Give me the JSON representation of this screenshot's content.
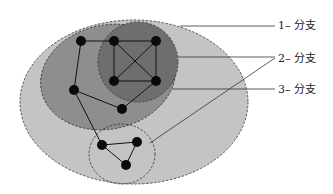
{
  "diagram": {
    "labels": [
      {
        "id": "branch-1",
        "text": "1– 分支",
        "x": 278,
        "y": 20
      },
      {
        "id": "branch-2",
        "text": "2– 分支",
        "x": 278,
        "y": 53
      },
      {
        "id": "branch-3",
        "text": "3– 分支",
        "x": 278,
        "y": 84
      }
    ],
    "regions": [
      {
        "name": "outer-region",
        "shape": "ellipse",
        "cx": 134,
        "cy": 102,
        "rx": 114,
        "ry": 82,
        "fill": "#c4c4c4"
      },
      {
        "name": "middle-region",
        "shape": "ellipse",
        "cx": 108,
        "cy": 77,
        "rx": 68,
        "ry": 52,
        "fill": "#8e8e8e"
      },
      {
        "name": "inner-region",
        "shape": "ellipse",
        "cx": 138,
        "cy": 62,
        "rx": 40,
        "ry": 40,
        "fill": "#6e6e6e"
      },
      {
        "name": "small-region",
        "shape": "ellipse",
        "cx": 122,
        "cy": 154,
        "rx": 33,
        "ry": 30,
        "fill": "#c4c4c4"
      }
    ],
    "nodes": [
      {
        "id": 1,
        "x": 81,
        "y": 41
      },
      {
        "id": 2,
        "x": 114,
        "y": 41
      },
      {
        "id": 3,
        "x": 156,
        "y": 41
      },
      {
        "id": 4,
        "x": 114,
        "y": 81
      },
      {
        "id": 5,
        "x": 156,
        "y": 81
      },
      {
        "id": 6,
        "x": 74,
        "y": 90
      },
      {
        "id": 7,
        "x": 122,
        "y": 109
      },
      {
        "id": 8,
        "x": 102,
        "y": 145
      },
      {
        "id": 9,
        "x": 137,
        "y": 142
      },
      {
        "id": 10,
        "x": 126,
        "y": 165
      }
    ],
    "edges": [
      [
        1,
        2
      ],
      [
        2,
        3
      ],
      [
        2,
        4
      ],
      [
        3,
        5
      ],
      [
        4,
        5
      ],
      [
        2,
        5
      ],
      [
        3,
        4
      ],
      [
        1,
        6
      ],
      [
        6,
        7
      ],
      [
        7,
        5
      ],
      [
        6,
        8
      ],
      [
        8,
        9
      ],
      [
        9,
        10
      ],
      [
        8,
        10
      ]
    ],
    "leader_lines": [
      {
        "label": "branch-1",
        "points": [
          [
            180,
            26
          ],
          [
            275,
            26
          ]
        ]
      },
      {
        "label": "branch-2",
        "points": [
          [
            178,
            57
          ],
          [
            275,
            57
          ]
        ]
      },
      {
        "label": "branch-2",
        "points": [
          [
            150,
            143
          ],
          [
            275,
            58
          ]
        ]
      },
      {
        "label": "branch-3",
        "points": [
          [
            172,
            89
          ],
          [
            275,
            89
          ]
        ]
      }
    ]
  }
}
